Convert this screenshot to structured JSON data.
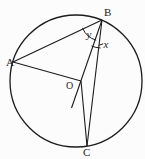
{
  "figure": {
    "background": "#fcfcfc",
    "stroke_color": "#1c1c1c",
    "labels": {
      "point_a": "A",
      "point_b": "B",
      "point_c": "C",
      "center_o": "O",
      "angle_y": "y",
      "angle_x": "x"
    }
  }
}
